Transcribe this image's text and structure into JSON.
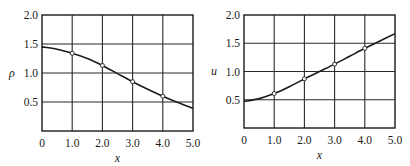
{
  "chart_data": [
    {
      "type": "line",
      "title": "",
      "xlabel": "x",
      "ylabel": "ρ",
      "xlim": [
        0,
        5.0
      ],
      "ylim": [
        0,
        2.0
      ],
      "x_ticks": [
        "0",
        "1.0",
        "2.0",
        "3.0",
        "4.0",
        "5.0"
      ],
      "y_ticks": [
        "0.5",
        "1.0",
        "1.5",
        "2.0"
      ],
      "grid": true,
      "legend": null,
      "series": [
        {
          "name": "curve",
          "x": [
            0,
            0.5,
            1.0,
            1.5,
            2.0,
            2.5,
            3.0,
            3.5,
            4.0,
            4.5,
            5.0
          ],
          "values": [
            1.45,
            1.41,
            1.34,
            1.25,
            1.13,
            0.99,
            0.85,
            0.72,
            0.6,
            0.49,
            0.39
          ]
        },
        {
          "name": "markers",
          "x": [
            1.0,
            2.0,
            3.0,
            4.0
          ],
          "values": [
            1.34,
            1.13,
            0.85,
            0.6
          ]
        }
      ]
    },
    {
      "type": "line",
      "title": "",
      "xlabel": "x",
      "ylabel": "u",
      "xlim": [
        0,
        5.0
      ],
      "ylim": [
        0,
        2.0
      ],
      "x_ticks": [
        "0",
        "1.0",
        "2.0",
        "3.0",
        "4.0",
        "5.0"
      ],
      "y_ticks": [
        "0.5",
        "1.0",
        "1.5",
        "2.0"
      ],
      "grid": true,
      "legend": null,
      "series": [
        {
          "name": "curve",
          "x": [
            0,
            0.5,
            1.0,
            1.5,
            2.0,
            2.5,
            3.0,
            3.5,
            4.0,
            4.5,
            5.0
          ],
          "values": [
            0.47,
            0.52,
            0.61,
            0.73,
            0.87,
            1.0,
            1.13,
            1.27,
            1.41,
            1.54,
            1.67
          ]
        },
        {
          "name": "markers",
          "x": [
            1.0,
            2.0,
            3.0,
            4.0
          ],
          "values": [
            0.61,
            0.87,
            1.13,
            1.41
          ]
        }
      ]
    }
  ],
  "plots": [
    {
      "ylabel": "ρ",
      "xlabel": "x"
    },
    {
      "ylabel": "u",
      "xlabel": "x"
    }
  ]
}
